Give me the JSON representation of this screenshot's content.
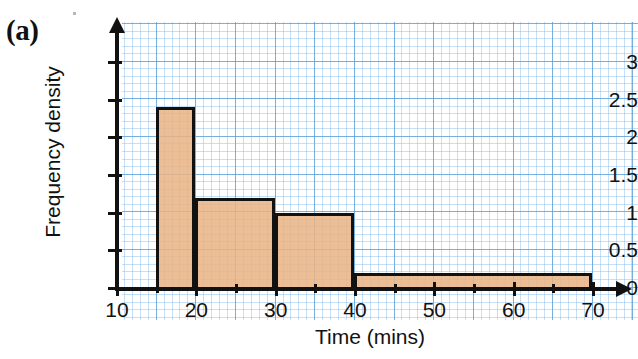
{
  "figure": {
    "label": "(a)",
    "background": "#ffffff",
    "grid_color": "#5aa0dc",
    "bar_fill": "#e8b385",
    "bar_stroke": "#111111"
  },
  "chart_data": {
    "type": "bar",
    "title": "",
    "subtitle": "",
    "xlabel": "Time (mins)",
    "ylabel": "Frequency density",
    "xlim": [
      10,
      72
    ],
    "ylim": [
      0,
      3.2
    ],
    "grid": true,
    "legend": "none",
    "xticks": [
      10,
      20,
      30,
      40,
      50,
      60,
      70
    ],
    "xtick_labels": [
      "10",
      "20",
      "30",
      "40",
      "50",
      "60",
      "70"
    ],
    "xticks_minor": [
      15,
      25,
      35,
      45,
      55,
      65
    ],
    "yticks": [
      0,
      0.5,
      1,
      1.5,
      2,
      2.5,
      3
    ],
    "ytick_labels": [
      "0",
      "0.5",
      "1",
      "1.5",
      "2",
      "2.5",
      "3"
    ],
    "bins": [
      {
        "start": 15,
        "end": 20,
        "value": 2.4
      },
      {
        "start": 20,
        "end": 30,
        "value": 1.2
      },
      {
        "start": 30,
        "end": 40,
        "value": 1.0
      },
      {
        "start": 40,
        "end": 70,
        "value": 0.2
      }
    ],
    "categories": [
      "15-20",
      "20-30",
      "30-40",
      "40-70"
    ],
    "values": [
      2.4,
      1.2,
      1.0,
      0.2
    ]
  }
}
